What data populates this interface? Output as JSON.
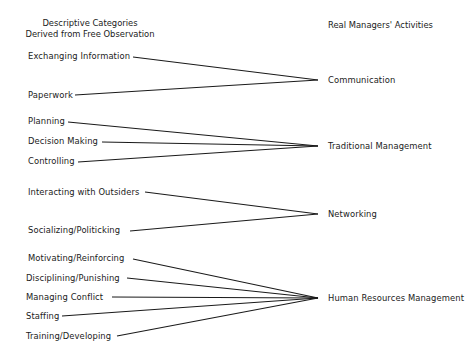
{
  "headers": {
    "left_line1": "Descriptive Categories",
    "left_line2": "Derived from Free Observation",
    "right": "Real Managers' Activities"
  },
  "groups": [
    {
      "activity": "Communication",
      "categories": [
        "Exchanging Information",
        "Paperwork"
      ]
    },
    {
      "activity": "Traditional Management",
      "categories": [
        "Planning",
        "Decision Making",
        "Controlling"
      ]
    },
    {
      "activity": "Networking",
      "categories": [
        "Interacting with Outsiders",
        "Socializing/Politicking"
      ]
    },
    {
      "activity": "Human Resources Management",
      "categories": [
        "Motivating/Reinforcing",
        "Disciplining/Punishing",
        "Managing Conflict",
        "Staffing",
        "Training/Developing"
      ]
    }
  ],
  "colors": {
    "line": "#1a1a1a",
    "background": "#ffffff",
    "text": "#1a1a1a"
  }
}
